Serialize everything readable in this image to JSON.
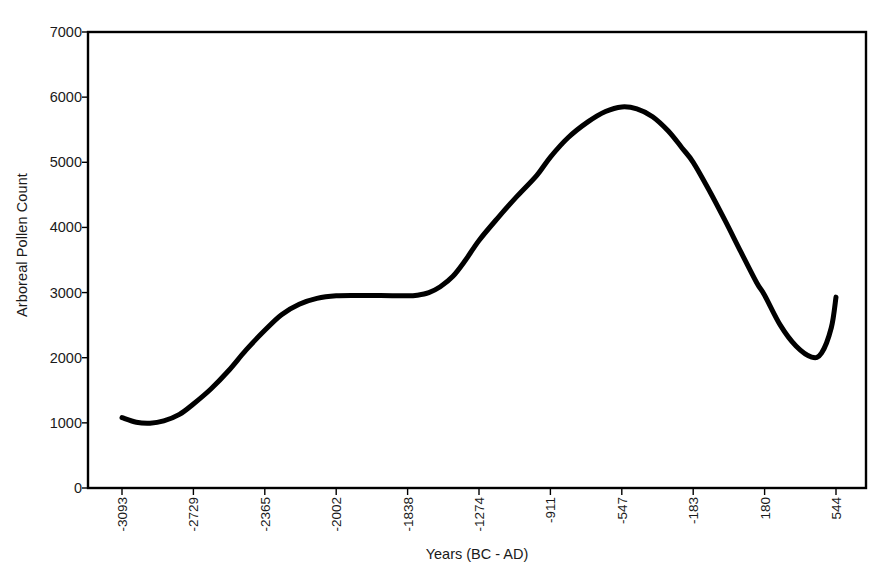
{
  "chart_data": {
    "type": "line",
    "title": "",
    "xlabel": "Years (BC - AD)",
    "ylabel": "Arboreal Pollen Count",
    "xlim": [
      -3093,
      544
    ],
    "ylim": [
      0,
      7000
    ],
    "grid": false,
    "legend": "none",
    "line_color": "#000000",
    "frame_color": "#000000",
    "x_tick_labels": [
      "-3093",
      "-2729",
      "-2365",
      "-2002",
      "-1838",
      "-1274",
      "-911",
      "-547",
      "-183",
      "180",
      "544"
    ],
    "y_tick_labels": [
      "0",
      "1000",
      "2000",
      "3000",
      "4000",
      "5000",
      "6000",
      "7000"
    ],
    "y_ticks": [
      0,
      1000,
      2000,
      3000,
      4000,
      5000,
      6000,
      7000
    ],
    "series": [
      {
        "name": "Arboreal Pollen Count",
        "x": [
          -3093,
          -3020,
          -2950,
          -2880,
          -2800,
          -2729,
          -2640,
          -2550,
          -2460,
          -2365,
          -2280,
          -2190,
          -2100,
          -2002,
          -1950,
          -1900,
          -1838,
          -1760,
          -1670,
          -1580,
          -1480,
          -1380,
          -1274,
          -1180,
          -1080,
          -980,
          -911,
          -820,
          -720,
          -630,
          -547,
          -470,
          -390,
          -310,
          -240,
          -183,
          -100,
          -20,
          60,
          140,
          180,
          260,
          340,
          420,
          470,
          520,
          544
        ],
        "values": [
          1080,
          1010,
          995,
          1030,
          1130,
          1290,
          1520,
          1800,
          2120,
          2420,
          2660,
          2820,
          2910,
          2950,
          2955,
          2955,
          2950,
          2960,
          3000,
          3090,
          3250,
          3500,
          3800,
          4140,
          4480,
          4800,
          5080,
          5380,
          5620,
          5780,
          5850,
          5820,
          5700,
          5480,
          5220,
          5000,
          4560,
          4100,
          3620,
          3150,
          2960,
          2500,
          2180,
          2010,
          2070,
          2460,
          2930
        ]
      }
    ],
    "annotations": []
  },
  "axis": {
    "y_title": "Arboreal Pollen Count",
    "x_title": "Years (BC - AD)"
  }
}
